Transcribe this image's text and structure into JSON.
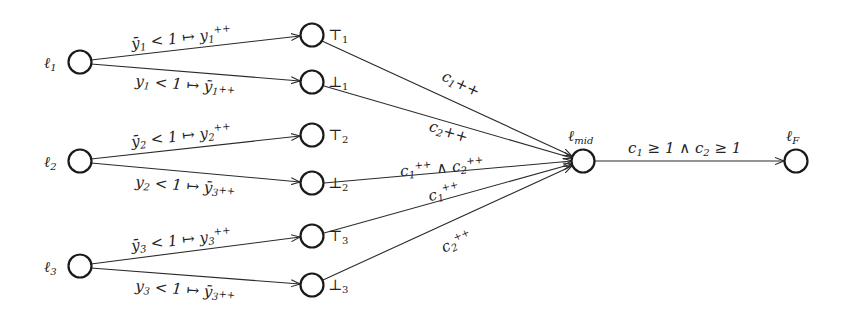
{
  "diagram": {
    "type": "automaton",
    "nodes": [
      {
        "id": "l1",
        "label": "ℓ",
        "sub": "1",
        "x": 80,
        "y": 62
      },
      {
        "id": "l2",
        "label": "ℓ",
        "sub": "2",
        "x": 80,
        "y": 161
      },
      {
        "id": "l3",
        "label": "ℓ",
        "sub": "3",
        "x": 80,
        "y": 266
      },
      {
        "id": "top1",
        "label": "⊤",
        "sub": "1",
        "x": 312,
        "y": 35
      },
      {
        "id": "bot1",
        "label": "⊥",
        "sub": "1",
        "x": 312,
        "y": 82
      },
      {
        "id": "top2",
        "label": "⊤",
        "sub": "2",
        "x": 312,
        "y": 135
      },
      {
        "id": "bot2",
        "label": "⊥",
        "sub": "2",
        "x": 312,
        "y": 183
      },
      {
        "id": "top3",
        "label": "⊤",
        "sub": "3",
        "x": 312,
        "y": 236
      },
      {
        "id": "bot3",
        "label": "⊥",
        "sub": "3",
        "x": 312,
        "y": 285
      },
      {
        "id": "lmid",
        "label": "ℓ",
        "sub": "mid",
        "x": 583,
        "y": 161
      },
      {
        "id": "lF",
        "label": "ℓ",
        "sub": "F",
        "x": 796,
        "y": 161
      }
    ],
    "edges": [
      {
        "from": "l1",
        "to": "top1",
        "label": "ȳ₁ < 1 ↦ y₁⁺⁺"
      },
      {
        "from": "l1",
        "to": "bot1",
        "label": "y₁ < 1 ↦ ȳ₁++"
      },
      {
        "from": "l2",
        "to": "top2",
        "label": "ȳ₂ < 1 ↦ y₂⁺⁺"
      },
      {
        "from": "l2",
        "to": "bot2",
        "label": "y₂ < 1 ↦ ȳ₃++"
      },
      {
        "from": "l3",
        "to": "top3",
        "label": "ȳ₃ < 1 ↦ y₃⁺⁺"
      },
      {
        "from": "l3",
        "to": "bot3",
        "label": "y₃ < 1 ↦ ȳ₃++"
      },
      {
        "from": "top1",
        "to": "lmid",
        "label": "c₁++"
      },
      {
        "from": "bot1",
        "to": "lmid",
        "label": "c₂++"
      },
      {
        "from": "bot2",
        "to": "lmid",
        "label": "c₁⁺⁺ ∧ c₂⁺⁺"
      },
      {
        "from": "top3",
        "to": "lmid",
        "label": "c₁⁺⁺"
      },
      {
        "from": "bot3",
        "to": "lmid",
        "label": "c₂⁺⁺"
      },
      {
        "from": "lmid",
        "to": "lF",
        "label": "c₁ ≥ 1 ∧ c₂ ≥ 1"
      }
    ]
  },
  "text": {
    "l1": "ℓ",
    "l1_sub": "1",
    "l2": "ℓ",
    "l2_sub": "2",
    "l3": "ℓ",
    "l3_sub": "3",
    "top": "⊤",
    "bot": "⊥",
    "s1": "1",
    "s2": "2",
    "s3": "3",
    "lmid": "ℓ",
    "lmid_sub": "mid",
    "lF": "ℓ",
    "lF_sub": "F",
    "e_l1_top_a": "ȳ",
    "e_l1_top_b": "1",
    "e_l1_top_c": " < 1 ↦ y",
    "e_l1_top_d": "1",
    "e_l1_top_e": "++",
    "e_l1_bot_a": "y",
    "e_l1_bot_b": "1",
    "e_l1_bot_c": " < 1 ↦ ȳ",
    "e_l1_bot_d": "1",
    "e_l1_bot_e": "++",
    "e_l2_top_a": "ȳ",
    "e_l2_top_b": "2",
    "e_l2_top_c": " < 1 ↦ y",
    "e_l2_top_d": "2",
    "e_l2_top_e": "++",
    "e_l2_bot_a": "y",
    "e_l2_bot_b": "2",
    "e_l2_bot_c": " < 1 ↦ ȳ",
    "e_l2_bot_d": "3",
    "e_l2_bot_e": "++",
    "e_l3_top_a": "ȳ",
    "e_l3_top_b": "3",
    "e_l3_top_c": " < 1 ↦ y",
    "e_l3_top_d": "3",
    "e_l3_top_e": "++",
    "e_l3_bot_a": "y",
    "e_l3_bot_b": "3",
    "e_l3_bot_c": " < 1 ↦ ȳ",
    "e_l3_bot_d": "3",
    "e_l3_bot_e": "++",
    "c": "c",
    "pp": "++",
    "and": " ∧ ",
    "final_a": "c",
    "final_b": "1",
    "final_c": " ≥ 1 ∧ c",
    "final_d": "2",
    "final_e": " ≥ 1"
  }
}
